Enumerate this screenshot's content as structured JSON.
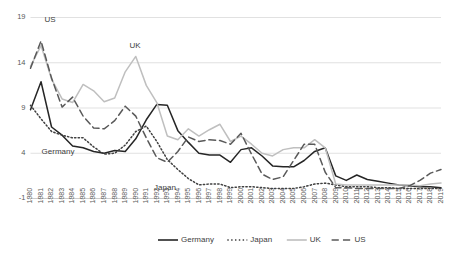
{
  "chart_data": {
    "type": "line",
    "title": "",
    "xlabel": "",
    "ylabel": "",
    "ylim": [
      -1,
      19
    ],
    "yticks": [
      -1,
      4,
      9,
      14,
      19
    ],
    "ytick_labels": [
      "-1",
      "4",
      "9",
      "14",
      "19"
    ],
    "grid": true,
    "legend_position": "bottom",
    "x": [
      1980,
      1981,
      1982,
      1983,
      1984,
      1985,
      1986,
      1987,
      1988,
      1989,
      1990,
      1991,
      1992,
      1993,
      1994,
      1995,
      1996,
      1997,
      1998,
      1999,
      2000,
      2001,
      2002,
      2003,
      2004,
      2005,
      2006,
      2007,
      2008,
      2009,
      2010,
      2011,
      2012,
      2013,
      2014,
      2015,
      2016,
      2017,
      2018,
      2019
    ],
    "xtick_labels": [
      "1980",
      "1981",
      "1982",
      "1983",
      "1984",
      "1985",
      "1986",
      "1987",
      "1988",
      "1989",
      "1990",
      "1991",
      "1992",
      "1993",
      "1994",
      "1995",
      "1996",
      "1997",
      "1998",
      "1999",
      "2000",
      "2001",
      "2002",
      "2003",
      "2004",
      "2005",
      "2006",
      "2007",
      "2008",
      "2009",
      "2010",
      "2011",
      "2012",
      "2013",
      "2014",
      "2015",
      "2016",
      "2017",
      "2018",
      "2019"
    ],
    "series": [
      {
        "name": "Germany",
        "color": "#262626",
        "style": "solid",
        "width": 1.5,
        "values": [
          8.8,
          11.9,
          6.9,
          6.0,
          4.8,
          4.6,
          4.2,
          4.0,
          4.3,
          4.2,
          5.6,
          7.7,
          9.4,
          9.3,
          6.5,
          5.2,
          4.0,
          3.8,
          3.8,
          3.0,
          4.4,
          4.6,
          3.7,
          2.6,
          2.5,
          2.5,
          3.2,
          4.2,
          4.6,
          1.5,
          1.0,
          1.6,
          1.1,
          0.9,
          0.7,
          0.5,
          0.4,
          0.3,
          0.3,
          0.2
        ],
        "annotation": "Germany"
      },
      {
        "name": "Japan",
        "color": "#404040",
        "style": "dotted",
        "width": 1.5,
        "values": [
          9.3,
          7.8,
          6.4,
          6.0,
          5.7,
          5.7,
          4.7,
          3.9,
          4.0,
          4.9,
          6.4,
          7.0,
          5.3,
          3.3,
          2.2,
          1.2,
          0.5,
          0.6,
          0.6,
          0.2,
          0.3,
          0.3,
          0.2,
          0.1,
          0.1,
          0.1,
          0.3,
          0.6,
          0.7,
          0.5,
          0.3,
          0.3,
          0.3,
          0.2,
          0.2,
          0.1,
          0.1,
          0.1,
          0.1,
          0.1
        ],
        "annotation": "Japan"
      },
      {
        "name": "UK",
        "color": "#bfbfbf",
        "style": "solid",
        "width": 1.5,
        "values": [
          13.6,
          15.9,
          12.2,
          10.0,
          9.6,
          11.6,
          10.9,
          9.7,
          10.1,
          13.0,
          14.7,
          11.5,
          9.6,
          5.9,
          5.5,
          6.7,
          5.9,
          6.6,
          7.2,
          5.3,
          5.9,
          5.0,
          4.0,
          3.7,
          4.4,
          4.6,
          4.6,
          5.5,
          4.6,
          0.6,
          0.5,
          0.5,
          0.5,
          0.5,
          0.5,
          0.5,
          0.5,
          0.4,
          0.6,
          0.7
        ],
        "annotation": "UK"
      },
      {
        "name": "US",
        "color": "#595959",
        "style": "dashed",
        "width": 1.5,
        "values": [
          13.4,
          16.4,
          12.3,
          9.1,
          10.2,
          8.1,
          6.8,
          6.7,
          7.6,
          9.2,
          8.1,
          5.7,
          3.5,
          3.0,
          4.2,
          5.8,
          5.3,
          5.5,
          5.4,
          5.0,
          6.2,
          3.9,
          1.7,
          1.1,
          1.4,
          3.2,
          5.0,
          5.0,
          1.9,
          0.2,
          0.2,
          0.1,
          0.1,
          0.1,
          0.1,
          0.1,
          0.4,
          1.0,
          1.8,
          2.2
        ],
        "annotation": "US"
      }
    ],
    "annotations": [
      {
        "text": "US",
        "x_px": 50,
        "y_px": 20
      },
      {
        "text": "UK",
        "x_px": 135,
        "y_px": 46
      },
      {
        "text": "Germany",
        "x_px": 58,
        "y_px": 152
      },
      {
        "text": "Japan",
        "x_px": 165,
        "y_px": 188
      }
    ]
  },
  "legend": {
    "items": [
      {
        "label": "Germany",
        "style": "solid",
        "color": "#262626"
      },
      {
        "label": "Japan",
        "style": "dotted",
        "color": "#404040"
      },
      {
        "label": "UK",
        "style": "solid",
        "color": "#bfbfbf"
      },
      {
        "label": "US",
        "style": "dashed",
        "color": "#595959"
      }
    ]
  }
}
